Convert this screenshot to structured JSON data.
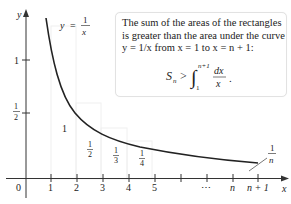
{
  "figure": {
    "curve_label": {
      "lhs": "y",
      "eq": "=",
      "num": "1",
      "den": "x"
    },
    "axes": {
      "x_label": "x",
      "y_label": "y",
      "origin_label": "0",
      "y_ticks": [
        {
          "label": "1"
        },
        {
          "label_num": "1",
          "label_den": "2"
        }
      ],
      "x_ticks": [
        "1",
        "2",
        "3",
        "4",
        "5",
        "",
        "⋯",
        "n",
        "n + 1"
      ]
    },
    "rect_labels": [
      {
        "text": "1"
      },
      {
        "num": "1",
        "den": "2"
      },
      {
        "num": "1",
        "den": "3"
      },
      {
        "num": "1",
        "den": "4"
      }
    ],
    "end_label": {
      "num": "1",
      "den": "n"
    },
    "callout": {
      "line1": "The sum of the areas of the rectangles",
      "line2": "is greater than the area under the curve",
      "line3": "y = 1/x from x = 1 to x = n + 1:",
      "formula": {
        "lhs": "S",
        "lhs_sub": "n",
        "op": ">",
        "upper": "n+1",
        "lower": "1",
        "num": "dx",
        "den": "x",
        "trail": "."
      }
    },
    "colors": {
      "curve": "#222222",
      "axis": "#333333",
      "rect": "#f3f3f3",
      "box_border": "#e2e2e2"
    }
  }
}
